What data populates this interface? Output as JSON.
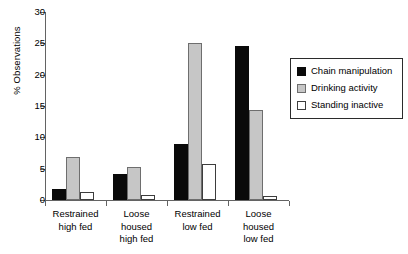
{
  "chart_data": {
    "type": "bar",
    "title": "",
    "xlabel": "",
    "ylabel": "% Observations",
    "ylim": [
      0,
      30
    ],
    "yticks": [
      0,
      5,
      10,
      15,
      20,
      25,
      30
    ],
    "grid": false,
    "legend_position": "right",
    "categories": [
      "Restrained high fed",
      "Loose housed high fed",
      "Restrained low fed",
      "Loose housed low fed"
    ],
    "category_lines": [
      [
        "Restrained",
        "high fed"
      ],
      [
        "Loose",
        "housed",
        "high fed"
      ],
      [
        "Restrained",
        "low fed"
      ],
      [
        "Loose",
        "housed",
        "low fed"
      ]
    ],
    "series": [
      {
        "name": "Chain manipulation",
        "color": "#0a0a0a",
        "values": [
          1.8,
          4.1,
          8.9,
          24.6
        ]
      },
      {
        "name": "Drinking activity",
        "color": "#c6c6c6",
        "values": [
          6.8,
          5.2,
          25.0,
          14.4
        ]
      },
      {
        "name": "Standing inactive",
        "color": "#ffffff",
        "values": [
          1.2,
          0.8,
          5.8,
          0.7
        ]
      }
    ]
  }
}
